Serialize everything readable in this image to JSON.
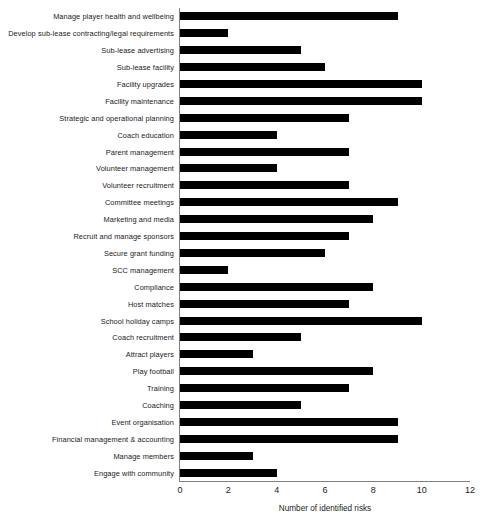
{
  "chart_data": {
    "type": "bar",
    "orientation": "horizontal",
    "title": "",
    "subtitle": "",
    "xlabel": "Number of identified risks",
    "ylabel": "",
    "xlim": [
      0,
      12
    ],
    "xticks": [
      0,
      2,
      4,
      6,
      8,
      10,
      12
    ],
    "grid": false,
    "legend": false,
    "bar_color": "#000000",
    "axis_color": "#808080",
    "categories": [
      "Manage player health and wellbeing",
      "Develop sub-lease contracting/legal requirements",
      "Sub-lease advertising",
      "Sub-lease facility",
      "Facility upgrades",
      "Facility maintenance",
      "Strategic and operational planning",
      "Coach education",
      "Parent management",
      "Volunteer management",
      "Volunteer recruitment",
      "Committee meetings",
      "Marketing and media",
      "Recruit and manage sponsors",
      "Secure grant funding",
      "SCC management",
      "Compliance",
      "Host matches",
      "School holiday camps",
      "Coach recruitment",
      "Attract players",
      "Play football",
      "Training",
      "Coaching",
      "Event organisation",
      "Financial management & accounting",
      "Manage members",
      "Engage with community"
    ],
    "values": [
      9,
      2,
      5,
      6,
      10,
      10,
      7,
      4,
      7,
      4,
      7,
      9,
      8,
      7,
      6,
      2,
      8,
      7,
      10,
      5,
      3,
      8,
      7,
      5,
      9,
      9,
      3,
      4
    ]
  }
}
